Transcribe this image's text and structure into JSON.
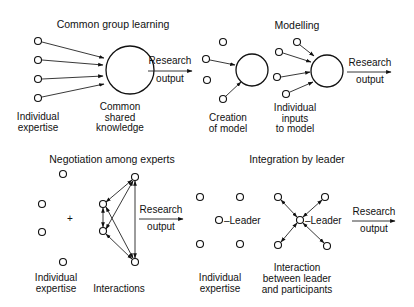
{
  "panels": {
    "common": {
      "title": "Common group learning",
      "inputs_label": [
        "Individual",
        "expertise"
      ],
      "center_label": [
        "Common",
        "shared",
        "knowledge"
      ],
      "output_label": [
        "Research",
        "output"
      ]
    },
    "creation": {
      "label": [
        "Creation",
        "of model"
      ]
    },
    "modelling": {
      "title": "Modelling",
      "inputs_label": [
        "Individual",
        "inputs",
        "to model"
      ],
      "output_label": [
        "Research",
        "output"
      ]
    },
    "negotiation": {
      "title": "Negotiation among experts",
      "plus": "+",
      "inputs_label": [
        "Individual",
        "expertise"
      ],
      "interactions_label": "Interactions",
      "output_label": [
        "Research",
        "output"
      ]
    },
    "integration": {
      "title": "Integration by leader",
      "leader_label": "–Leader",
      "inputs_label": [
        "Individual",
        "expertise"
      ],
      "interaction_label": [
        "Interaction",
        "between leader",
        "and participants"
      ],
      "output_label": [
        "Research",
        "output"
      ]
    }
  },
  "colors": {
    "stroke": "#111111",
    "background": "#ffffff"
  }
}
